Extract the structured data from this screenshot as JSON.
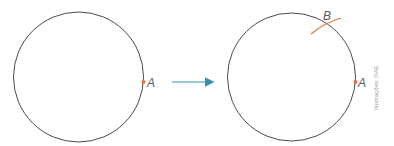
{
  "diagram": {
    "left_figure": {
      "point_label": "A"
    },
    "right_figure": {
      "point_a_label": "A",
      "point_b_label": "B"
    },
    "credit": "Ilustrações: DAE",
    "colors": {
      "circle": "#4a4a4a",
      "point": "#e8743b",
      "arc": "#e8743b",
      "arrow": "#3a8fb0",
      "label": "#5a5a5a"
    }
  }
}
